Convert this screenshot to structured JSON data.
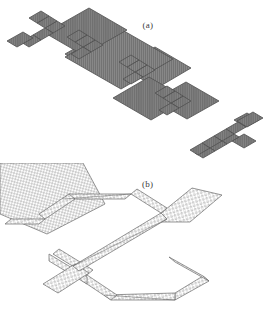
{
  "figure": {
    "background_color": "#ffffff",
    "orientation_note": "rotated-180",
    "panels": [
      {
        "id": "a",
        "label": "(a)",
        "label_rendered_as": "(ɐ)",
        "description": "array of textured island pads joined by serpentine interconnects, isometric view",
        "fill_color": "#6f6f6f",
        "line_color": "#555555",
        "texture": "fine-vertical-hatch",
        "island_count": 5,
        "serpentine_count": 6
      },
      {
        "id": "b",
        "label": "(b)",
        "label_rendered_as": "(q)",
        "description": "magnified view of one serpentine interconnect and adjoining pads, open mesh lattice",
        "fill_color": "#ffffff",
        "line_color": "#6a6a6a",
        "texture": "dot-mesh-lattice",
        "island_count": 2,
        "serpentine_count": 1
      }
    ]
  },
  "colors": {
    "page": "#ffffff",
    "dark_fill": "#6f6f6f",
    "dark_stroke": "#4f4f4f",
    "light_stroke": "#6a6a6a",
    "mesh_dot": "#8a8a8a",
    "label_text": "#3a3a3a"
  }
}
